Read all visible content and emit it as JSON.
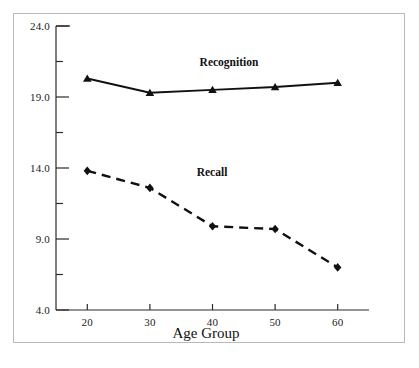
{
  "figure": {
    "frame_border_color": "#b9b9b9",
    "background_color": "#ffffff",
    "ink_color": "#111111"
  },
  "chart_data": {
    "type": "line",
    "title": "",
    "xlabel": "Age Group",
    "ylabel": "",
    "categories": [
      20,
      30,
      40,
      50,
      60
    ],
    "x": [
      20,
      30,
      40,
      50,
      60
    ],
    "xlim": [
      15,
      65
    ],
    "ylim": [
      4.0,
      24.0
    ],
    "grid": false,
    "legend_position": "inline-annotation",
    "y_major_ticks": [
      4.0,
      9.0,
      14.0,
      19.0,
      24.0
    ],
    "y_major_tick_labels": [
      "4.0",
      "9.0",
      "14.0",
      "19.0",
      "24.0"
    ],
    "y_minor_ticks": [
      6.5,
      11.5,
      16.5,
      21.5
    ],
    "x_tick_labels": [
      "20",
      "30",
      "40",
      "50",
      "60"
    ],
    "series": [
      {
        "name": "Recognition",
        "values": [
          20.3,
          19.3,
          19.5,
          19.7,
          20.0
        ],
        "marker": "triangle",
        "linestyle": "solid",
        "color": "#111111",
        "label_x": 40,
        "label_y": 21.8
      },
      {
        "name": "Recall",
        "values": [
          13.8,
          12.6,
          9.9,
          9.7,
          7.0
        ],
        "marker": "diamond",
        "linestyle": "dashed",
        "color": "#111111",
        "label_x": 37,
        "label_y": 14.1
      }
    ],
    "annotations": [
      {
        "text": "Recognition",
        "x": 40,
        "y": 21.8
      },
      {
        "text": "Recall",
        "x": 37,
        "y": 14.1
      }
    ]
  },
  "caption": {
    "text": ""
  }
}
